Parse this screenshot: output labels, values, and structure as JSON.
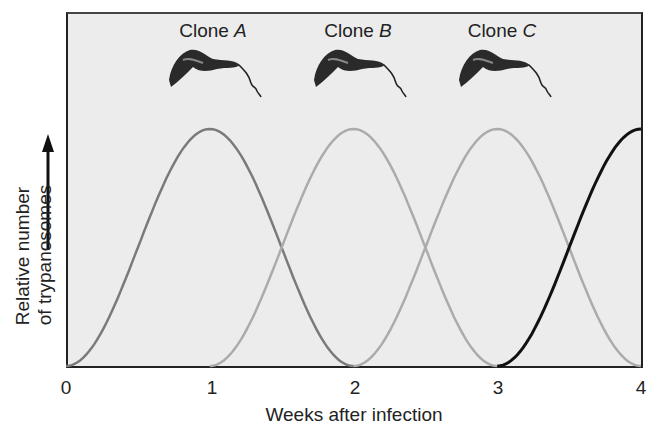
{
  "chart_data": {
    "type": "line",
    "title": "",
    "xlabel": "Weeks after infection",
    "ylabel": "Relative number of trypanosomes",
    "ylabel_lines": [
      "Relative number",
      "of trypanosomes"
    ],
    "x_ticks": [
      "0",
      "1",
      "2",
      "3",
      "4"
    ],
    "xlim": [
      0,
      4
    ],
    "ylim": [
      0,
      1
    ],
    "grid": false,
    "legend": "annotations above peaks",
    "x": [
      0,
      0.25,
      0.5,
      0.75,
      1,
      1.25,
      1.5,
      1.75,
      2,
      2.25,
      2.5,
      2.75,
      3,
      3.25,
      3.5,
      3.75,
      4
    ],
    "series": [
      {
        "name": "Clone A",
        "color": "#7a7a7a",
        "peak_week": 1,
        "values": [
          0,
          0.12,
          0.45,
          0.85,
          1,
          0.85,
          0.45,
          0.12,
          0,
          null,
          null,
          null,
          null,
          null,
          null,
          null,
          null
        ]
      },
      {
        "name": "Clone B",
        "color": "#ababab",
        "peak_week": 2,
        "values": [
          null,
          null,
          null,
          null,
          0,
          0.12,
          0.45,
          0.85,
          1,
          0.85,
          0.45,
          0.12,
          0,
          null,
          null,
          null,
          null
        ]
      },
      {
        "name": "Clone C",
        "color": "#ababab",
        "peak_week": 3,
        "values": [
          null,
          null,
          null,
          null,
          null,
          null,
          null,
          null,
          0,
          0.12,
          0.45,
          0.85,
          1,
          0.85,
          0.45,
          0.12,
          0
        ]
      },
      {
        "name": "Next clone",
        "color": "#111111",
        "peak_week": 4,
        "values": [
          null,
          null,
          null,
          null,
          null,
          null,
          null,
          null,
          null,
          null,
          null,
          null,
          0,
          0.12,
          0.45,
          0.85,
          1
        ]
      }
    ],
    "annotations": [
      {
        "text": "Clone",
        "italic": "A",
        "x": 1,
        "icon": "trypanosome-icon"
      },
      {
        "text": "Clone",
        "italic": "B",
        "x": 2,
        "icon": "trypanosome-icon"
      },
      {
        "text": "Clone",
        "italic": "C",
        "x": 3,
        "icon": "trypanosome-icon"
      }
    ]
  },
  "labels": {
    "clone_a": "Clone ",
    "clone_a_letter": "A",
    "clone_b": "Clone ",
    "clone_b_letter": "B",
    "clone_c": "Clone ",
    "clone_c_letter": "C",
    "ylabel_line1": "Relative number",
    "ylabel_line2": "of trypanosomes",
    "xlabel": "Weeks after infection",
    "ticks": [
      "0",
      "1",
      "2",
      "3",
      "4"
    ]
  }
}
